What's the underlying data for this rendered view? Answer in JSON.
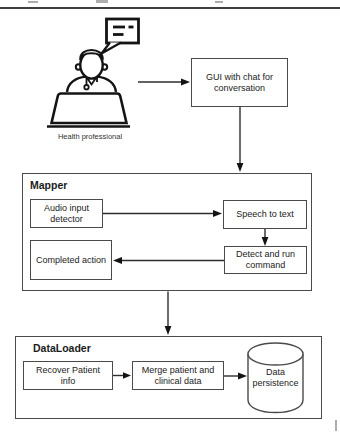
{
  "figure": {
    "type": "flowchart",
    "top_rule": true
  },
  "colors": {
    "background": "#ffffff",
    "shape_stroke": "#4a4a4a",
    "edge_stroke": "#2e2e2e",
    "icon_stroke": "#141414",
    "text": "#222222",
    "top_rule": "#3f3f3f"
  },
  "actor": {
    "label": "Health professional",
    "icon": "health-professional-at-laptop-icon",
    "bubble_icon": "chat-bubble-icon"
  },
  "containers": {
    "mapper": {
      "title": "Mapper"
    },
    "dataloader": {
      "title": "DataLoader"
    }
  },
  "nodes": {
    "gui": {
      "label": "GUI with chat for\nconversation"
    },
    "audio_input": {
      "label": "Audio input\ndetector"
    },
    "speech_to_text": {
      "label": "Speech to text"
    },
    "detect_run": {
      "label": "Detect and run\ncommand"
    },
    "completed_action": {
      "label": "Completed action"
    },
    "recover_patient": {
      "label": "Recover Patient\ninfo"
    },
    "merge_data": {
      "label": "Merge patient and\nclinical data"
    },
    "data_persistence": {
      "label": "Data\npersistence",
      "shape": "database-cylinder-icon"
    }
  },
  "edges": [
    {
      "from": "health-professional",
      "to": "gui"
    },
    {
      "from": "gui",
      "to": "mapper"
    },
    {
      "from": "audio_input",
      "to": "speech_to_text"
    },
    {
      "from": "speech_to_text",
      "to": "detect_run"
    },
    {
      "from": "detect_run",
      "to": "completed_action"
    },
    {
      "from": "mapper",
      "to": "dataloader"
    },
    {
      "from": "recover_patient",
      "to": "merge_data"
    },
    {
      "from": "merge_data",
      "to": "data_persistence"
    }
  ]
}
